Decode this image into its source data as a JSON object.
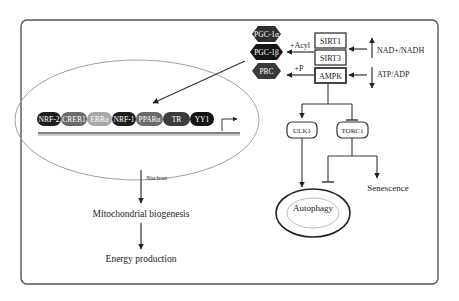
{
  "diagram": {
    "coactivators": [
      {
        "label": "PGC-1α",
        "color": "#2e2e2e"
      },
      {
        "label": "PGC-1β",
        "color": "#141414"
      },
      {
        "label": "PRC",
        "color": "#3a3a3a"
      }
    ],
    "sensors": [
      {
        "label": "SIRT1"
      },
      {
        "label": "SIRT3"
      },
      {
        "label": "AMPK"
      }
    ],
    "modifications": {
      "acyl": "+Acyl",
      "phospho": "+P"
    },
    "signals": {
      "nad": "NAD+/NADH",
      "atp": "ATP/ADP"
    },
    "transcription_factors": [
      {
        "label": "NRF-2",
        "color": "#1e1e1e"
      },
      {
        "label": "CREB1",
        "color": "#6a6a6a"
      },
      {
        "label": "ERRα",
        "color": "#a8a8a8"
      },
      {
        "label": "NRF-1",
        "color": "#1e1e1e"
      },
      {
        "label": "PPARα",
        "color": "#6a6a6a"
      },
      {
        "label": "TR",
        "color": "#3c3c3c"
      },
      {
        "label": "YY1",
        "color": "#141414"
      }
    ],
    "nucleus_label": "Nucleus",
    "outcomes": {
      "biogenesis": "Mitochondrial biogenesis",
      "energy": "Energy production"
    },
    "downstream": {
      "ulk1": "ULK1",
      "torc1": "TORC1",
      "senescence": "Senescence",
      "autophagy_line1": "Autophagy",
      "autophagy_line2": "mitophagy"
    }
  }
}
